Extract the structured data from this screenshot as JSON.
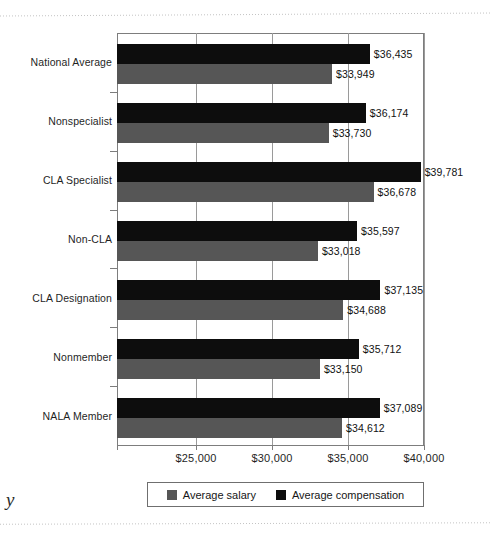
{
  "page": {
    "bleed_letter": "y"
  },
  "chart_data": {
    "type": "bar",
    "orientation": "horizontal",
    "title": "",
    "xlabel": "",
    "ylabel": "",
    "grid": true,
    "legend_position": "bottom",
    "xlim": [
      19800,
      40000
    ],
    "xticks": [
      25000,
      30000,
      35000,
      40000
    ],
    "xtick_labels": [
      "$25,000",
      "$30,000",
      "$35,000",
      "$40,000"
    ],
    "categories": [
      "National Average",
      "Nonspecialist",
      "CLA Specialist",
      "Non-CLA",
      "CLA Designation",
      "Nonmember",
      "NALA Member"
    ],
    "series": [
      {
        "name": "Average compensation",
        "color": "#0d0d0d",
        "values": [
          36435,
          36174,
          39781,
          35597,
          37135,
          35712,
          37089
        ],
        "labels": [
          "$36,435",
          "$36,174",
          "$39,781",
          "$35,597",
          "$37,135",
          "$35,712",
          "$37,089"
        ]
      },
      {
        "name": "Average salary",
        "color": "#565656",
        "values": [
          33949,
          33730,
          36678,
          33018,
          34688,
          33150,
          34612
        ],
        "labels": [
          "$33,949",
          "$33,730",
          "$36,678",
          "$33,018",
          "$34,688",
          "$33,150",
          "$34,612"
        ]
      }
    ],
    "legend": [
      {
        "label": "Average salary",
        "color": "#565656"
      },
      {
        "label": "Average compensation",
        "color": "#0d0d0d"
      }
    ]
  }
}
